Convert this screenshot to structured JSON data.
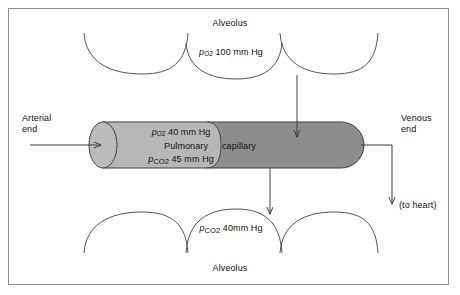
{
  "figure": {
    "frame_color": "#8e8e90",
    "background": "#ffffff"
  },
  "colors": {
    "capillary_light": "#b7b7b7",
    "capillary_dark": "#8d8d8d",
    "cap_end_light": "#bcbcbc",
    "stroke": "#3f3f3f",
    "text": "#111111"
  },
  "labels": {
    "alveolus_top": "Alveolus",
    "alveolus_bottom": "Alveolus",
    "arterial_end": "Arterial\nend",
    "arterial_end_line1": "Arterial",
    "arterial_end_line2": "end",
    "venous_end_line1": "Venous",
    "venous_end_line2": "end",
    "to_heart": "(to heart)",
    "pulmonary": "Pulmonary",
    "capillary": "capillary"
  },
  "gas_values": {
    "alveolar_po2": {
      "symbol": "p",
      "subscript": "O",
      "subscript_number": "2",
      "value": "100",
      "units": "mm Hg",
      "full_text": "pO2 100 mm Hg",
      "location": "top-alveolus"
    },
    "capillary_po2": {
      "symbol": "p",
      "subscript": "O",
      "subscript_number": "2",
      "value": "40",
      "units": "mm Hg",
      "full_text": "pO2 40 mm Hg",
      "location": "arterial-end-of-capillary"
    },
    "capillary_pco2": {
      "symbol": "p",
      "subscript": "CO",
      "subscript_number": "2",
      "value": "45",
      "units": "mm Hg",
      "full_text": "pCO2 45 mm Hg",
      "location": "arterial-end-of-capillary"
    },
    "alveolar_pco2": {
      "symbol": "p",
      "subscript": "CO",
      "subscript_number": "2",
      "value": "40",
      "units": "mm Hg",
      "full_text": "pCO2 40mm Hg",
      "location": "bottom-alveolus"
    }
  },
  "arrows": [
    {
      "name": "blood-inflow-arrow",
      "direction": "right",
      "meaning": "arterial blood entering capillary"
    },
    {
      "name": "oxygen-diffusion-arrow",
      "direction": "down",
      "meaning": "O2 from alveolus into capillary"
    },
    {
      "name": "carbon-dioxide-diffusion-arrow",
      "direction": "down",
      "meaning": "CO2 from capillary into alveolus"
    },
    {
      "name": "blood-outflow-arrow",
      "direction": "down",
      "meaning": "venous blood to heart"
    }
  ]
}
